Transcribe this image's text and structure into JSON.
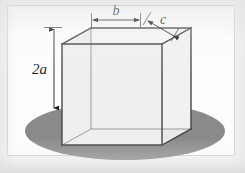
{
  "figure": {
    "type": "geometry-diagram",
    "solid": "rectangular box (cuboid)",
    "shadow_shape": "ellipse",
    "colors": {
      "page_background": "#f2f2f2",
      "frame_background": "#fdfdfd",
      "frame_border": "#cfcfcf",
      "front_face": "#eeeeee",
      "top_face": "#f5f5f5",
      "right_face": "#f1f1f1",
      "edge_dark": "#454545",
      "edge_light": "#9a9a9a",
      "shadow_ellipse": "#8a8a8a",
      "annotation": "#1d1d1d"
    },
    "labels": {
      "height": "2a",
      "width": "b",
      "depth": "c"
    },
    "annotations": [
      {
        "name": "height-dimension",
        "label": "2a",
        "orientation": "vertical",
        "arrow": "double-headed"
      },
      {
        "name": "width-dimension",
        "label": "b",
        "orientation": "horizontal",
        "arrow": "double-headed"
      },
      {
        "name": "depth-dimension",
        "label": "c",
        "orientation": "diagonal",
        "arrow": "double-headed"
      }
    ]
  }
}
